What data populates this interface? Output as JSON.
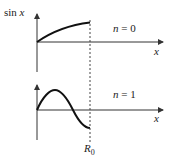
{
  "diagram": {
    "top_panel": {
      "y_label": "sin x",
      "y_label_fn": "sin",
      "y_label_var": "x",
      "x_label": "x",
      "mode_label": "n = 0",
      "mode_var": "n",
      "mode_value": "= 0"
    },
    "bottom_panel": {
      "x_label": "x",
      "mode_label": "n = 1",
      "mode_var": "n",
      "mode_value": "= 1",
      "boundary_label": "R",
      "boundary_subscript": "0"
    },
    "colors": {
      "curve": "#111111",
      "axis": "#333333",
      "dashed": "#444444"
    }
  }
}
